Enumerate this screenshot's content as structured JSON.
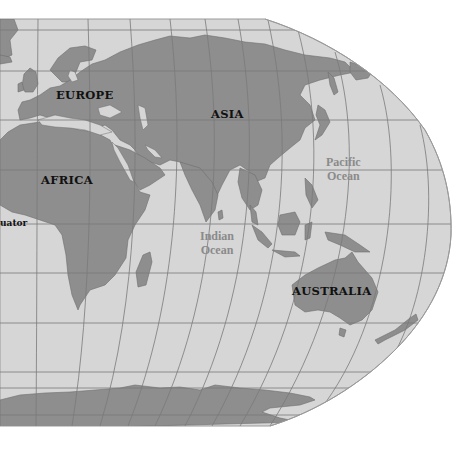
{
  "map": {
    "projection": "Robinson-style world map (eastern hemisphere crop)",
    "colors": {
      "background": "#ffffff",
      "ocean": "#d6d6d6",
      "land": "#8e8e8e",
      "grid": "#7a7a7a",
      "land_label": "#111111",
      "ocean_label": "#8a8a8a"
    },
    "labels": {
      "europe": "EUROPE",
      "asia": "ASIA",
      "africa": "AFRICA",
      "australia": "AUSTRALIA",
      "indian_ocean_line1": "Indian",
      "indian_ocean_line2": "Ocean",
      "pacific_ocean_line1": "Pacific",
      "pacific_ocean_line2": "Ocean",
      "equator": "uator"
    }
  }
}
